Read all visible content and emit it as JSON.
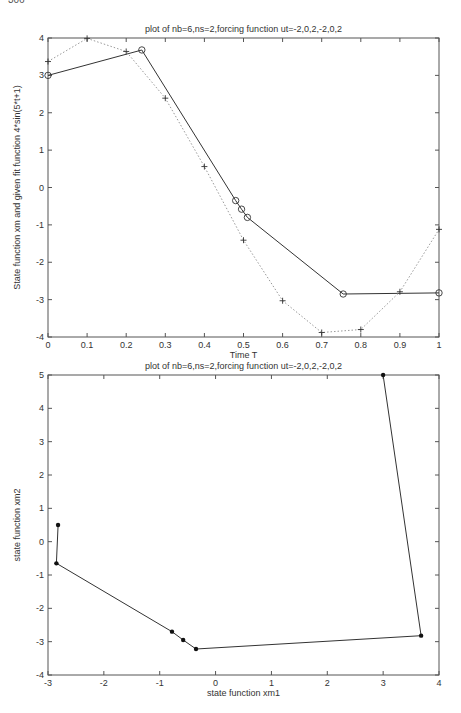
{
  "page": {
    "number": "306"
  },
  "chart_data": [
    {
      "type": "line",
      "title": "plot of nb=6,ns=2,forcing function ut=-2,0,2,-2,0,2",
      "xlabel": "Time T",
      "ylabel": "State function xm and given fit function 4*sin(5*t+1)",
      "xlim": [
        0,
        1
      ],
      "ylim": [
        -4,
        4
      ],
      "xticks": [
        "0",
        "0.1",
        "0.2",
        "0.3",
        "0.4",
        "0.5",
        "0.6",
        "0.7",
        "0.8",
        "0.9",
        "1"
      ],
      "yticks": [
        "4",
        "3",
        "2",
        "1",
        "0",
        "-1",
        "-2",
        "-3",
        "-4"
      ],
      "grid": false,
      "series": [
        {
          "name": "state function xm",
          "style": "solid",
          "marker": "o",
          "color": "#333333",
          "x": [
            0.0,
            0.24,
            0.48,
            0.495,
            0.51,
            0.755,
            1.0
          ],
          "y": [
            3.0,
            3.68,
            -0.35,
            -0.58,
            -0.8,
            -2.85,
            -2.82
          ]
        },
        {
          "name": "fit function 4*sin(5*t+1)",
          "style": "dotted",
          "marker": "+",
          "color": "#999999",
          "x": [
            0.0,
            0.1,
            0.2,
            0.3,
            0.4,
            0.5,
            0.6,
            0.7,
            0.8,
            0.9,
            1.0
          ],
          "y": [
            3.37,
            3.99,
            3.64,
            2.39,
            0.56,
            -1.41,
            -3.03,
            -3.88,
            -3.8,
            -2.79,
            -1.12
          ]
        }
      ]
    },
    {
      "type": "line",
      "title": "plot of nb=6,ns=2,forcing function ut=-2,0,2,-2,0,2",
      "xlabel": "state function xm1",
      "ylabel": "state function xm2",
      "xlim": [
        -3,
        4
      ],
      "ylim": [
        -4,
        5
      ],
      "xticks": [
        "-3",
        "-2",
        "-1",
        "0",
        "1",
        "2",
        "3",
        "4"
      ],
      "yticks": [
        "5",
        "4",
        "3",
        "2",
        "1",
        "0",
        "-1",
        "-2",
        "-3",
        "-4"
      ],
      "grid": false,
      "series": [
        {
          "name": "phase trajectory",
          "style": "solid",
          "marker": "*",
          "color": "#333333",
          "x": [
            -2.82,
            -2.85,
            -0.78,
            -0.58,
            -0.35,
            3.68,
            3.0
          ],
          "y": [
            0.5,
            -0.65,
            -2.7,
            -2.95,
            -3.22,
            -2.82,
            5.0
          ]
        }
      ]
    }
  ]
}
